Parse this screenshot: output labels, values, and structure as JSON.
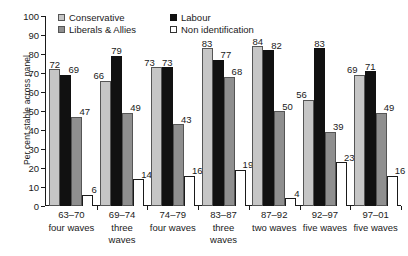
{
  "chart_data": {
    "type": "bar",
    "title": "",
    "xlabel": "",
    "ylabel": "Per cent stable across panel",
    "ylim": [
      0,
      100
    ],
    "ytick_step": 10,
    "yticks": [
      0,
      10,
      20,
      30,
      40,
      50,
      60,
      70,
      80,
      90,
      100
    ],
    "grid": false,
    "legend_position": "top-left",
    "categories": [
      "63–70",
      "69–74",
      "74–79",
      "83–87",
      "87–92",
      "92–97",
      "97–01"
    ],
    "category_sublabels": [
      "four waves",
      "three waves",
      "four waves",
      "three waves",
      "two waves",
      "five waves",
      "five waves"
    ],
    "series": [
      {
        "name": "Conservative",
        "key": "conservative",
        "color": "#c6c6c6",
        "values": [
          72,
          66,
          73,
          83,
          84,
          56,
          69
        ]
      },
      {
        "name": "Labour",
        "key": "labour",
        "color": "#111111",
        "values": [
          69,
          79,
          73,
          77,
          82,
          83,
          71
        ]
      },
      {
        "name": "Liberals & Allies",
        "key": "liberal",
        "color": "#8f8f8f",
        "values": [
          47,
          49,
          43,
          68,
          50,
          39,
          49
        ]
      },
      {
        "name": "Non identification",
        "key": "nonid",
        "color": "#ffffff",
        "values": [
          6,
          14,
          16,
          19,
          4,
          23,
          16
        ]
      }
    ]
  },
  "legend": {
    "items": [
      {
        "label": "Conservative",
        "swatch": "conservative"
      },
      {
        "label": "Labour",
        "swatch": "labour"
      },
      {
        "label": "Liberals & Allies",
        "swatch": "liberal"
      },
      {
        "label": "Non identification",
        "swatch": "nonid"
      }
    ]
  },
  "axes": {
    "y_title": "Per cent stable across panel"
  }
}
